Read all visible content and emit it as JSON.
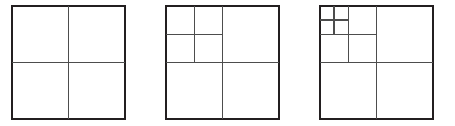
{
  "figure": {
    "name": "quadtree-subdivision-sequence",
    "background_color": "#ffffff",
    "outer_stroke_color": "#231f20",
    "inner_stroke_color": "#4d4d4d",
    "outer_stroke_width": 2,
    "inner_stroke_width": 1.4,
    "canvas": {
      "width": 455,
      "height": 126
    },
    "panels": [
      {
        "id": "panel-1",
        "label": "level-1-subdivision",
        "depth": 1,
        "x": 12,
        "y": 6,
        "size": 113,
        "divisions": [
          {
            "type": "vertical",
            "x": 68.5,
            "y1": 6,
            "y2": 119
          },
          {
            "type": "horizontal",
            "y": 62.5,
            "x1": 12,
            "x2": 125
          }
        ],
        "cell_count": 4
      },
      {
        "id": "panel-2",
        "label": "level-2-subdivision",
        "depth": 2,
        "x": 166,
        "y": 6,
        "size": 113,
        "divisions": [
          {
            "type": "vertical",
            "x": 222.5,
            "y1": 6,
            "y2": 119
          },
          {
            "type": "horizontal",
            "y": 62.5,
            "x1": 166,
            "x2": 279
          },
          {
            "type": "vertical",
            "x": 194.25,
            "y1": 6,
            "y2": 62.5
          },
          {
            "type": "horizontal",
            "y": 34.25,
            "x1": 166,
            "x2": 222.5
          }
        ],
        "cell_count": 7
      },
      {
        "id": "panel-3",
        "label": "level-3-subdivision",
        "depth": 3,
        "x": 320,
        "y": 6,
        "size": 113,
        "divisions": [
          {
            "type": "vertical",
            "x": 376.5,
            "y1": 6,
            "y2": 119
          },
          {
            "type": "horizontal",
            "y": 62.5,
            "x1": 320,
            "x2": 433
          },
          {
            "type": "vertical",
            "x": 348.25,
            "y1": 6,
            "y2": 62.5
          },
          {
            "type": "horizontal",
            "y": 34.25,
            "x1": 320,
            "x2": 376.5
          },
          {
            "type": "vertical",
            "x": 334.12,
            "y1": 6,
            "y2": 34.25
          },
          {
            "type": "horizontal",
            "y": 20.12,
            "x1": 320,
            "x2": 348.25
          }
        ],
        "cell_count": 10
      }
    ]
  }
}
